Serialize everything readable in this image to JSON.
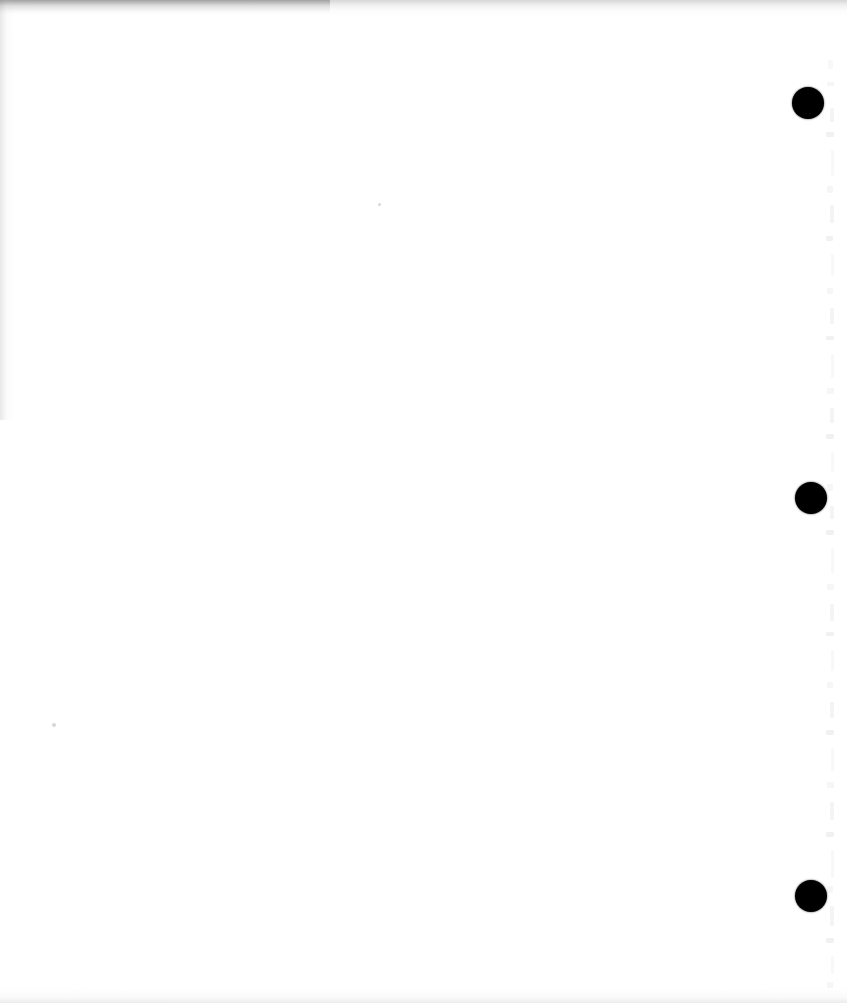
{
  "document": {
    "kind": "scanned-page",
    "page_label": "",
    "content_text": "",
    "note": "blank page",
    "width_px": 847,
    "height_px": 1003,
    "background_color": "#ffffff"
  },
  "marks": {
    "dot_color": "#000000",
    "registration_dots": [
      {
        "name": "registration-dot-top",
        "cx": 808,
        "cy": 103,
        "r": 16
      },
      {
        "name": "registration-dot-middle",
        "cx": 811,
        "cy": 498,
        "r": 16
      },
      {
        "name": "registration-dot-bottom",
        "cx": 811,
        "cy": 896,
        "r": 16
      }
    ],
    "specks": [
      {
        "name": "speck-left",
        "x": 52,
        "y": 723,
        "size": 4
      },
      {
        "name": "speck-mid",
        "x": 378,
        "y": 203,
        "size": 3
      }
    ]
  },
  "artifacts": {
    "ghost_color": "#e2e2e4",
    "shadow_color": "#5c5c5f",
    "bleed_marks": [
      {
        "x": 3,
        "y": 60,
        "w": 5,
        "h": 9
      },
      {
        "x": 2,
        "y": 82,
        "w": 7,
        "h": 4
      },
      {
        "x": 5,
        "y": 108,
        "w": 4,
        "h": 14
      },
      {
        "x": 1,
        "y": 132,
        "w": 8,
        "h": 5
      },
      {
        "x": 6,
        "y": 150,
        "w": 3,
        "h": 26
      },
      {
        "x": 2,
        "y": 186,
        "w": 6,
        "h": 7
      },
      {
        "x": 5,
        "y": 205,
        "w": 4,
        "h": 18
      },
      {
        "x": 1,
        "y": 236,
        "w": 7,
        "h": 5
      },
      {
        "x": 6,
        "y": 254,
        "w": 3,
        "h": 22
      },
      {
        "x": 2,
        "y": 288,
        "w": 6,
        "h": 6
      },
      {
        "x": 5,
        "y": 308,
        "w": 4,
        "h": 16
      },
      {
        "x": 1,
        "y": 336,
        "w": 8,
        "h": 4
      },
      {
        "x": 6,
        "y": 354,
        "w": 3,
        "h": 24
      },
      {
        "x": 2,
        "y": 388,
        "w": 7,
        "h": 6
      },
      {
        "x": 5,
        "y": 408,
        "w": 4,
        "h": 15
      },
      {
        "x": 1,
        "y": 434,
        "w": 8,
        "h": 5
      },
      {
        "x": 6,
        "y": 452,
        "w": 3,
        "h": 20
      },
      {
        "x": 2,
        "y": 484,
        "w": 6,
        "h": 7
      },
      {
        "x": 5,
        "y": 506,
        "w": 4,
        "h": 13
      },
      {
        "x": 1,
        "y": 530,
        "w": 8,
        "h": 5
      },
      {
        "x": 6,
        "y": 548,
        "w": 3,
        "h": 25
      },
      {
        "x": 2,
        "y": 584,
        "w": 7,
        "h": 6
      },
      {
        "x": 5,
        "y": 604,
        "w": 4,
        "h": 17
      },
      {
        "x": 1,
        "y": 632,
        "w": 8,
        "h": 4
      },
      {
        "x": 6,
        "y": 650,
        "w": 3,
        "h": 21
      },
      {
        "x": 2,
        "y": 682,
        "w": 6,
        "h": 6
      },
      {
        "x": 5,
        "y": 702,
        "w": 4,
        "h": 16
      },
      {
        "x": 1,
        "y": 730,
        "w": 8,
        "h": 5
      },
      {
        "x": 6,
        "y": 748,
        "w": 3,
        "h": 23
      },
      {
        "x": 2,
        "y": 782,
        "w": 7,
        "h": 6
      },
      {
        "x": 5,
        "y": 802,
        "w": 4,
        "h": 18
      },
      {
        "x": 1,
        "y": 832,
        "w": 8,
        "h": 5
      },
      {
        "x": 6,
        "y": 850,
        "w": 3,
        "h": 28
      },
      {
        "x": 2,
        "y": 886,
        "w": 6,
        "h": 7
      },
      {
        "x": 5,
        "y": 906,
        "w": 4,
        "h": 20
      },
      {
        "x": 1,
        "y": 938,
        "w": 8,
        "h": 5
      },
      {
        "x": 6,
        "y": 956,
        "w": 3,
        "h": 18
      },
      {
        "x": 2,
        "y": 982,
        "w": 6,
        "h": 6
      }
    ]
  }
}
